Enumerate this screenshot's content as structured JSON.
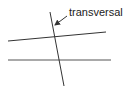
{
  "diagram": {
    "label": "transversal",
    "line_color": "#333333",
    "lines": {
      "upper": {
        "x1": 8,
        "y1": 41,
        "x2": 106,
        "y2": 32
      },
      "lower": {
        "x1": 8,
        "y1": 60,
        "x2": 111,
        "y2": 60
      },
      "transversal": {
        "x1": 50,
        "y1": 12,
        "x2": 64,
        "y2": 86
      }
    },
    "arrow": {
      "x1": 67,
      "y1": 16,
      "x2": 54,
      "y2": 26
    }
  }
}
